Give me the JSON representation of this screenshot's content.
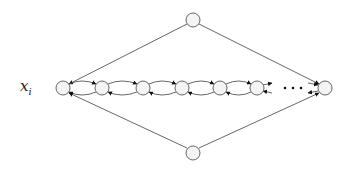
{
  "diagram": {
    "label": {
      "base": "x",
      "sub": "i"
    },
    "ellipsis": "· · ·",
    "colors": {
      "node_fill": "#f2f2f2",
      "stroke": "#555555",
      "arrow": "#111111"
    },
    "nodes": {
      "top": {
        "x": 193,
        "y": 20
      },
      "bottom": {
        "x": 193,
        "y": 153
      },
      "chain": [
        {
          "x": 63,
          "y": 88
        },
        {
          "x": 102,
          "y": 88
        },
        {
          "x": 143,
          "y": 88
        },
        {
          "x": 182,
          "y": 88
        },
        {
          "x": 220,
          "y": 88
        },
        {
          "x": 257,
          "y": 88
        },
        {
          "x": 325,
          "y": 88
        }
      ]
    },
    "node_radius": 7
  }
}
